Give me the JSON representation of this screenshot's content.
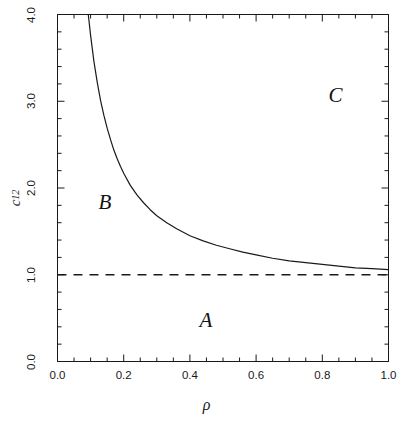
{
  "chart_data": {
    "type": "line",
    "title": "",
    "xlabel": "ρ",
    "ylabel": "c₁₂",
    "ylabel_base": "c",
    "ylabel_sub": "12",
    "xlim": [
      0.0,
      1.0
    ],
    "ylim": [
      0.0,
      4.0
    ],
    "grid": false,
    "legend": "none",
    "x_ticks": [
      "0.0",
      "0.2",
      "0.4",
      "0.6",
      "0.8",
      "1.0"
    ],
    "x_tick_values": [
      0.0,
      0.2,
      0.4,
      0.6,
      0.8,
      1.0
    ],
    "x_minor_step": 0.05,
    "y_ticks": [
      "0.0",
      "1.0",
      "2.0",
      "3.0",
      "4.0"
    ],
    "y_tick_values": [
      0.0,
      1.0,
      2.0,
      3.0,
      4.0
    ],
    "y_minor_step": 0.2,
    "series": [
      {
        "name": "boundary-curve",
        "style": "solid",
        "color": "#1a1a1a",
        "x": [
          0.093,
          0.1,
          0.11,
          0.12,
          0.13,
          0.14,
          0.15,
          0.16,
          0.17,
          0.18,
          0.19,
          0.2,
          0.22,
          0.24,
          0.26,
          0.28,
          0.3,
          0.33,
          0.36,
          0.4,
          0.44,
          0.48,
          0.52,
          0.56,
          0.6,
          0.65,
          0.7,
          0.75,
          0.8,
          0.85,
          0.9,
          0.95,
          1.0
        ],
        "y": [
          4.0,
          3.76,
          3.46,
          3.22,
          3.01,
          2.84,
          2.69,
          2.56,
          2.44,
          2.34,
          2.25,
          2.17,
          2.03,
          1.92,
          1.83,
          1.75,
          1.68,
          1.6,
          1.53,
          1.45,
          1.39,
          1.34,
          1.3,
          1.26,
          1.23,
          1.19,
          1.16,
          1.14,
          1.12,
          1.1,
          1.08,
          1.07,
          1.06
        ]
      },
      {
        "name": "asymptote-line",
        "style": "dashed",
        "color": "#1a1a1a",
        "x": [
          0.0,
          1.0
        ],
        "y": [
          1.0,
          1.0
        ]
      }
    ],
    "annotations": [
      {
        "text": "A",
        "x": 0.45,
        "y": 0.45
      },
      {
        "text": "B",
        "x": 0.145,
        "y": 1.82
      },
      {
        "text": "C",
        "x": 0.84,
        "y": 3.05
      }
    ]
  }
}
